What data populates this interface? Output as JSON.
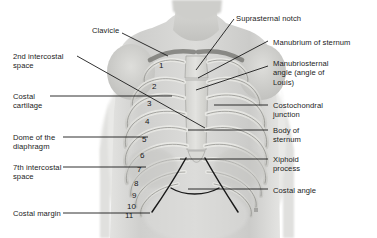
{
  "figure": {
    "background_color": "#ffffff",
    "text_color": "#1b1b1b",
    "leader_line_color": "#1a1a1a",
    "width": 377,
    "height": 238
  },
  "labels_left": [
    {
      "name": "clavicle",
      "text": "Clavicle",
      "x": 92,
      "y": 26
    },
    {
      "name": "second-intercostal-space",
      "text": "2nd intercostal\nspace",
      "x": 13,
      "y": 52
    },
    {
      "name": "costal-cartilage",
      "text": "Costal\ncartilage",
      "x": 13,
      "y": 92
    },
    {
      "name": "dome-of-the-diaphragm",
      "text": "Dome of the\ndiaphragm",
      "x": 13,
      "y": 133
    },
    {
      "name": "seventh-intercostal-space",
      "text": "7th intercostal\nspace",
      "x": 13,
      "y": 163
    },
    {
      "name": "costal-margin",
      "text": "Costal margin",
      "x": 13,
      "y": 209
    }
  ],
  "labels_right": [
    {
      "name": "suprasternal-notch",
      "text": "Suprasternal notch",
      "x": 236,
      "y": 14
    },
    {
      "name": "manubrium-of-sternum",
      "text": "Manubrium of sternum",
      "x": 273,
      "y": 38
    },
    {
      "name": "manubriosternal-angle",
      "text": "Manubriosternal\nangle (angle of\nLouis)",
      "x": 273,
      "y": 59
    },
    {
      "name": "costochondral-junction",
      "text": "Costochondral\njunction",
      "x": 273,
      "y": 101
    },
    {
      "name": "body-of-sternum",
      "text": "Body of\nsternum",
      "x": 273,
      "y": 126
    },
    {
      "name": "xiphoid-process",
      "text": "Xiphoid\nprocess",
      "x": 273,
      "y": 155
    },
    {
      "name": "costal-angle",
      "text": "Costal angle",
      "x": 273,
      "y": 186
    }
  ],
  "rib_numbers": [
    {
      "label": "1",
      "x": 159,
      "y": 62
    },
    {
      "label": "2",
      "x": 152,
      "y": 83
    },
    {
      "label": "3",
      "x": 147,
      "y": 100
    },
    {
      "label": "4",
      "x": 145,
      "y": 118
    },
    {
      "label": "5",
      "x": 142,
      "y": 136
    },
    {
      "label": "6",
      "x": 140,
      "y": 152
    },
    {
      "label": "7",
      "x": 137,
      "y": 166
    },
    {
      "label": "8",
      "x": 134,
      "y": 180
    },
    {
      "label": "9",
      "x": 132,
      "y": 192
    },
    {
      "label": "10",
      "x": 127,
      "y": 203
    },
    {
      "label": "11",
      "x": 125,
      "y": 212
    }
  ],
  "leader_lines": [
    {
      "name": "leader-clavicle",
      "points": "122,33 168,56"
    },
    {
      "name": "leader-2nd-intercostal-space",
      "points": "77,56 205,128"
    },
    {
      "name": "leader-costal-cartilage",
      "points": "50,96 172,96"
    },
    {
      "name": "leader-dome-of-diaphragm",
      "points": "63,137 148,137"
    },
    {
      "name": "leader-7th-intercostal-space",
      "points": "63,167 146,167"
    },
    {
      "name": "leader-costal-margin",
      "points": "63,213 150,213"
    },
    {
      "name": "leader-suprasternal-notch",
      "points": "234,19 196,70"
    },
    {
      "name": "leader-manubrium",
      "points": "268,41 198,78"
    },
    {
      "name": "leader-manubriosternal-angle",
      "points": "268,66 196,90"
    },
    {
      "name": "leader-costochondral-junction",
      "points": "268,105 214,105"
    },
    {
      "name": "leader-body-of-sternum",
      "points": "268,130 188,130"
    },
    {
      "name": "leader-xiphoid-process",
      "points": "268,159 180,159"
    },
    {
      "name": "leader-costal-angle",
      "points": "268,189 188,189"
    }
  ]
}
